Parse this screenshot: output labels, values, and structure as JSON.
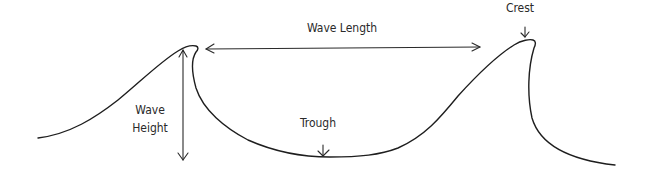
{
  "diagram": {
    "labels": {
      "wave_length": "Wave Length",
      "wave_height_line1": "Wave",
      "wave_height_line2": "Height",
      "trough": "Trough",
      "crest": "Crest"
    },
    "colors": {
      "background": "#ffffff",
      "line": "#1e1e1e",
      "text": "#2a2a2a"
    }
  }
}
